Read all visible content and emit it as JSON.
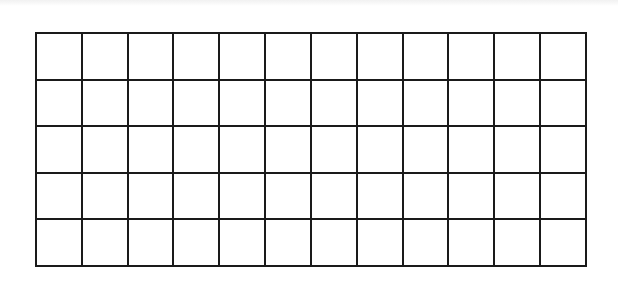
{
  "diagram": {
    "type": "empty-grid",
    "rows": 5,
    "columns": 12,
    "line_color": "#1a1a1a",
    "background_color": "#ffffff",
    "cell_values": [
      [
        "",
        "",
        "",
        "",
        "",
        "",
        "",
        "",
        "",
        "",
        "",
        ""
      ],
      [
        "",
        "",
        "",
        "",
        "",
        "",
        "",
        "",
        "",
        "",
        "",
        ""
      ],
      [
        "",
        "",
        "",
        "",
        "",
        "",
        "",
        "",
        "",
        "",
        "",
        ""
      ],
      [
        "",
        "",
        "",
        "",
        "",
        "",
        "",
        "",
        "",
        "",
        "",
        ""
      ],
      [
        "",
        "",
        "",
        "",
        "",
        "",
        "",
        "",
        "",
        "",
        "",
        ""
      ]
    ]
  }
}
